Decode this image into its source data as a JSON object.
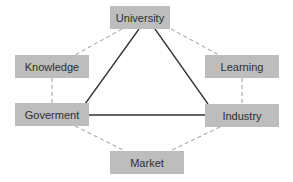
{
  "diagram": {
    "type": "triangle-relationship",
    "nodes": {
      "university": {
        "label": "University"
      },
      "knowledge": {
        "label": "Knowledge"
      },
      "learning": {
        "label": "Learning"
      },
      "government": {
        "label": "Goverment"
      },
      "industry": {
        "label": "Industry"
      },
      "market": {
        "label": "Market"
      }
    },
    "edges": [
      {
        "from": "University",
        "to": "Goverment",
        "style": "solid"
      },
      {
        "from": "University",
        "to": "Industry",
        "style": "solid"
      },
      {
        "from": "Goverment",
        "to": "Industry",
        "style": "solid"
      },
      {
        "from": "University",
        "to": "Knowledge",
        "style": "dashed"
      },
      {
        "from": "University",
        "to": "Learning",
        "style": "dashed"
      },
      {
        "from": "Knowledge",
        "to": "Goverment",
        "style": "dashed"
      },
      {
        "from": "Learning",
        "to": "Industry",
        "style": "dashed"
      },
      {
        "from": "Goverment",
        "to": "Market",
        "style": "dashed"
      },
      {
        "from": "Industry",
        "to": "Market",
        "style": "dashed"
      }
    ],
    "colors": {
      "box_fill": "#bdbdbd",
      "text": "#2e2e2e",
      "solid_line": "#333333",
      "dashed_line": "#9a9a9a"
    }
  }
}
